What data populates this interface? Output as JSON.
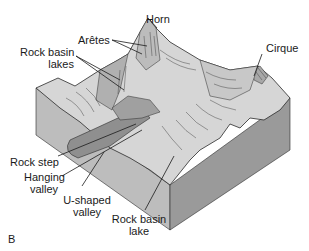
{
  "figure": {
    "panel_letter": "B",
    "labels": {
      "horn": "Horn",
      "aretes": "Arêtes",
      "rock_basin_lakes_1": "Rock basin",
      "rock_basin_lakes_2": "lakes",
      "cirque": "Cirque",
      "rock_step": "Rock step",
      "hanging_valley_1": "Hanging",
      "hanging_valley_2": "valley",
      "u_shaped_valley_1": "U-shaped",
      "u_shaped_valley_2": "valley",
      "rock_basin_lake_1": "Rock basin",
      "rock_basin_lake_2": "lake"
    },
    "colors": {
      "block_front": "#bdbdbd",
      "block_side": "#9a9a9a",
      "terrain_light": "#d6d6d6",
      "terrain_mid": "#b0b0b0",
      "valley_fill": "#8f8f8f",
      "line": "#2a2a2a"
    }
  }
}
